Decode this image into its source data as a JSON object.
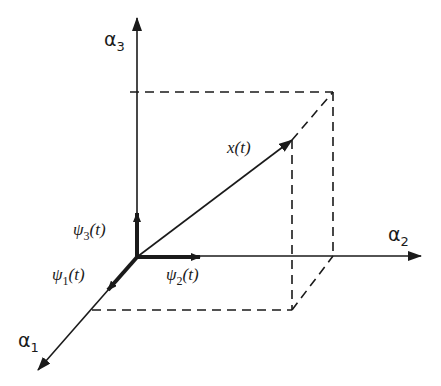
{
  "diagram": {
    "axes": {
      "alpha1": {
        "symbol": "α",
        "subscript": "1"
      },
      "alpha2": {
        "symbol": "α",
        "subscript": "2"
      },
      "alpha3": {
        "symbol": "α",
        "subscript": "3"
      }
    },
    "basis": {
      "psi1": {
        "symbol": "ψ",
        "subscript": "1",
        "arg": "(t)"
      },
      "psi2": {
        "symbol": "ψ",
        "subscript": "2",
        "arg": "(t)"
      },
      "psi3": {
        "symbol": "ψ",
        "subscript": "3",
        "arg": "(t)"
      }
    },
    "vector": {
      "label": "x(t)"
    },
    "colors": {
      "ink": "#1a1a1a",
      "background": "#ffffff"
    }
  }
}
